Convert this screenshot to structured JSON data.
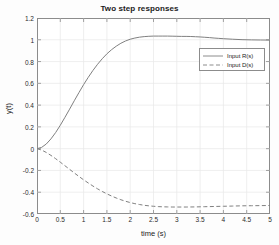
{
  "chart_data": {
    "type": "line",
    "title": "Two step responses",
    "xlabel": "time (s)",
    "ylabel": "y(t)",
    "xlim": [
      0,
      5
    ],
    "ylim": [
      -0.6,
      1.2
    ],
    "grid": true,
    "legend_position": "upper-right",
    "xticks": [
      "0",
      "0.5",
      "1",
      "1.5",
      "2",
      "2.5",
      "3",
      "3.5",
      "4",
      "4.5",
      "5"
    ],
    "xtick_values": [
      0,
      0.5,
      1,
      1.5,
      2,
      2.5,
      3,
      3.5,
      4,
      4.5,
      5
    ],
    "yticks": [
      "1.2",
      "1",
      "0.8",
      "0.6",
      "0.4",
      "0.2",
      "0",
      "-0.2",
      "-0.4",
      "-0.6"
    ],
    "ytick_values": [
      1.2,
      1,
      0.8,
      0.6,
      0.4,
      0.2,
      0,
      -0.2,
      -0.4,
      -0.6
    ],
    "series": [
      {
        "name": "Input R(s)",
        "style": "solid",
        "color": "#808080",
        "x": [
          0,
          0.1,
          0.2,
          0.3,
          0.4,
          0.5,
          0.6,
          0.7,
          0.8,
          0.9,
          1.0,
          1.1,
          1.2,
          1.3,
          1.4,
          1.5,
          1.6,
          1.7,
          1.8,
          1.9,
          2.0,
          2.1,
          2.2,
          2.3,
          2.4,
          2.5,
          2.6,
          2.7,
          2.8,
          2.9,
          3.0,
          3.1,
          3.2,
          3.3,
          3.4,
          3.5,
          3.6,
          3.7,
          3.8,
          3.9,
          4.0,
          4.2,
          4.4,
          4.6,
          4.8,
          5.0
        ],
        "y": [
          0.0,
          0.012,
          0.043,
          0.09,
          0.148,
          0.215,
          0.288,
          0.363,
          0.44,
          0.515,
          0.588,
          0.655,
          0.718,
          0.775,
          0.826,
          0.871,
          0.909,
          0.941,
          0.968,
          0.989,
          1.005,
          1.016,
          1.024,
          1.029,
          1.032,
          1.034,
          1.034,
          1.034,
          1.034,
          1.033,
          1.032,
          1.031,
          1.031,
          1.03,
          1.028,
          1.026,
          1.023,
          1.02,
          1.016,
          1.013,
          1.01,
          1.005,
          1.001,
          0.999,
          0.998,
          0.997
        ]
      },
      {
        "name": "Input D(s)",
        "style": "dashed",
        "color": "#808080",
        "x": [
          0,
          0.1,
          0.2,
          0.3,
          0.4,
          0.5,
          0.6,
          0.7,
          0.8,
          0.9,
          1.0,
          1.1,
          1.2,
          1.3,
          1.4,
          1.5,
          1.6,
          1.7,
          1.8,
          1.9,
          2.0,
          2.1,
          2.2,
          2.3,
          2.4,
          2.5,
          2.6,
          2.7,
          2.8,
          2.9,
          3.0,
          3.2,
          3.4,
          3.6,
          3.8,
          4.0,
          4.2,
          4.4,
          4.6,
          4.8,
          5.0
        ],
        "y": [
          0.0,
          -0.013,
          -0.035,
          -0.062,
          -0.092,
          -0.124,
          -0.157,
          -0.19,
          -0.223,
          -0.255,
          -0.286,
          -0.315,
          -0.343,
          -0.369,
          -0.393,
          -0.415,
          -0.435,
          -0.453,
          -0.469,
          -0.483,
          -0.495,
          -0.505,
          -0.513,
          -0.52,
          -0.525,
          -0.529,
          -0.532,
          -0.534,
          -0.535,
          -0.536,
          -0.536,
          -0.536,
          -0.535,
          -0.533,
          -0.531,
          -0.529,
          -0.527,
          -0.525,
          -0.524,
          -0.523,
          -0.522
        ]
      }
    ]
  },
  "legend": {
    "entries": [
      {
        "label": "Input R(s)",
        "style": "solid"
      },
      {
        "label": "Input D(s)",
        "style": "dashed"
      }
    ]
  },
  "colors": {
    "axis": "#8c8c8c",
    "grid": "#e8e8e8",
    "curve": "#808080",
    "text": "#1a1a1a",
    "background": "#fdfdfd",
    "plot_background": "#ffffff"
  }
}
